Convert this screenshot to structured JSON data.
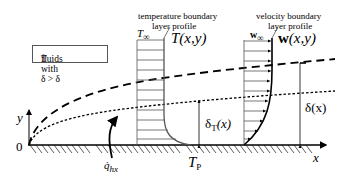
{
  "note_box": {
    "text_prefix": "fluids with δ > δ",
    "text_sub": "T"
  },
  "temperature_profile": {
    "caption_line1": "temperature boundary",
    "caption_line2": "layer profile",
    "free_stream_label": "T",
    "free_stream_sub": "∞",
    "function_label": "T(x,y)"
  },
  "velocity_profile": {
    "caption_line1": "velocity boundary",
    "caption_line2": "layer profile",
    "free_stream_label": "w",
    "free_stream_sub": "∞",
    "function_label_bold": "w",
    "function_label_rest": "(x,y)"
  },
  "axes": {
    "y_label": "y",
    "origin_label": "0",
    "x_label": "x"
  },
  "thicknesses": {
    "thermal_prefix": "δ",
    "thermal_sub": "T",
    "thermal_suffix": "(x)",
    "velocity": "δ(x)"
  },
  "wall": {
    "temperature_label": "T",
    "temperature_sub": "P",
    "heat_flux_label": "q̇",
    "heat_flux_sub": "hx"
  },
  "colors": {
    "line": "#000000",
    "profile_lines": "#555555",
    "box_border": "#555555"
  }
}
